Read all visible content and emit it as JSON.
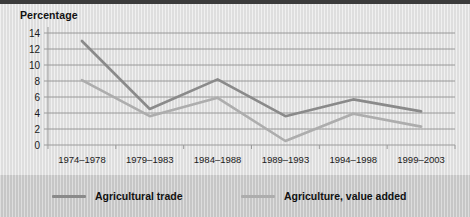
{
  "chart_data": {
    "type": "line",
    "title": "",
    "ylabel": "Percentage",
    "xlabel": "",
    "ylim": [
      0,
      14
    ],
    "ytick_step": 2,
    "yticks": [
      "0",
      "2",
      "4",
      "6",
      "8",
      "10",
      "12",
      "14"
    ],
    "grid": true,
    "legend_position": "bottom",
    "categories": [
      "1974–1978",
      "1979–1983",
      "1984–1988",
      "1989–1993",
      "1994–1998",
      "1999–2003"
    ],
    "series": [
      {
        "name": "Agricultural trade",
        "color": "#8a8a8a",
        "values": [
          13.0,
          4.5,
          8.2,
          3.6,
          5.7,
          4.2
        ]
      },
      {
        "name": "Agriculture, value added",
        "color": "#adadad",
        "values": [
          8.1,
          3.6,
          5.9,
          0.5,
          3.9,
          2.3
        ]
      }
    ]
  },
  "colors": {
    "panel_background": "#dedede",
    "legend_background": "#c6c6c6",
    "grid_line": "#8f8f8f",
    "axis_line": "#9a9a9a",
    "text": "#111111",
    "top_rule": "#3a3a3a"
  },
  "legend": {
    "items": [
      {
        "label": "Agricultural trade",
        "swatch_name": "legend-swatch-agricultural-trade"
      },
      {
        "label": "Agriculture, value added",
        "swatch_name": "legend-swatch-agriculture-value-added"
      }
    ]
  }
}
